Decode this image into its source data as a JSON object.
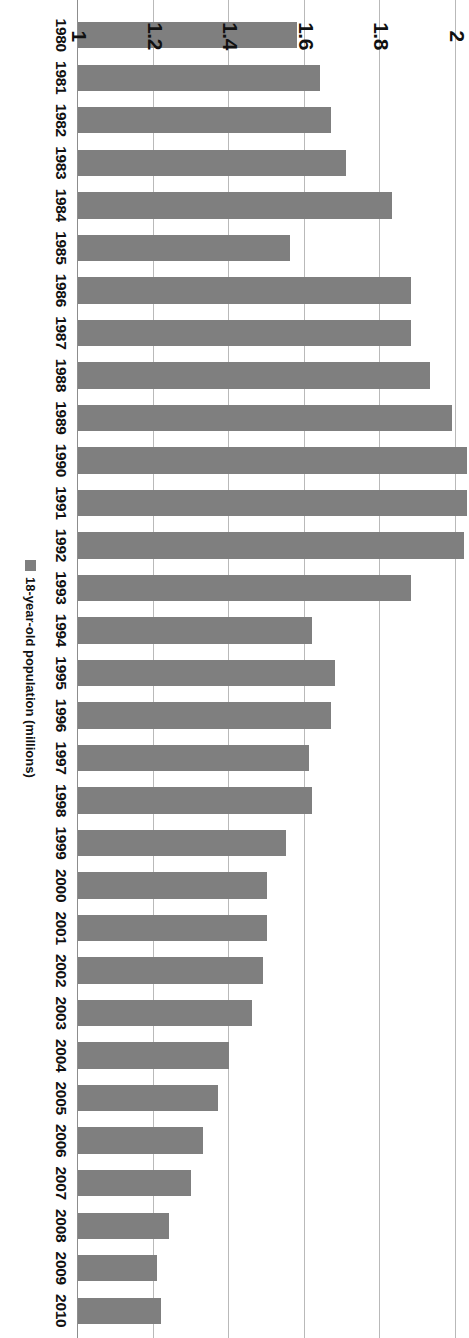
{
  "chart_data": {
    "type": "bar",
    "title": "",
    "subtitle": "",
    "orientation": "vertical",
    "xlabel": "",
    "ylabel": "",
    "legend": [
      "18-year-old population (millions)"
    ],
    "legend_position": "bottom",
    "grid": true,
    "ylim": [
      1,
      2
    ],
    "ytick_labels": [
      "1",
      "1.2",
      "1.4",
      "1.6",
      "1.8",
      "2"
    ],
    "ytick_values": [
      1,
      1.2,
      1.4,
      1.6,
      1.8,
      2
    ],
    "categories": [
      "1980",
      "1981",
      "1982",
      "1983",
      "1984",
      "1985",
      "1986",
      "1987",
      "1988",
      "1989",
      "1990",
      "1991",
      "1992",
      "1993",
      "1994",
      "1995",
      "1996",
      "1997",
      "1998",
      "1999",
      "2000",
      "2001",
      "2002",
      "2003",
      "2004",
      "2005",
      "2006",
      "2007",
      "2008",
      "2009",
      "2010"
    ],
    "series": [
      {
        "name": "18-year-old population (millions)",
        "color": "#7f7f7f",
        "values": [
          1.58,
          1.64,
          1.67,
          1.71,
          1.83,
          1.56,
          1.88,
          1.88,
          1.93,
          1.99,
          2.03,
          2.03,
          2.02,
          1.88,
          1.62,
          1.68,
          1.67,
          1.61,
          1.62,
          1.55,
          1.5,
          1.5,
          1.49,
          1.46,
          1.4,
          1.37,
          1.33,
          1.3,
          1.24,
          1.21,
          1.22
        ]
      }
    ]
  },
  "legend_entry": {
    "label": "18-year-old population (millions)",
    "swatch_color": "#7f7f7f"
  }
}
